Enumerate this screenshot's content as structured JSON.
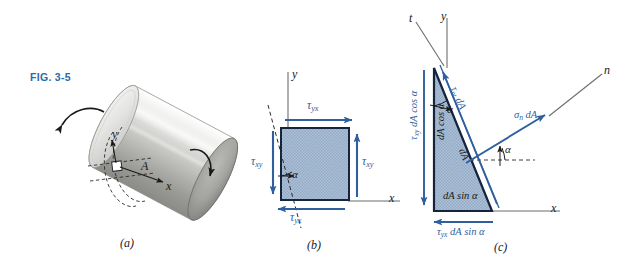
{
  "figure": {
    "id_label": "FIG. 3-5",
    "id_color": "#2f6aa8",
    "accent_color": "#2f5f9e",
    "fill_color": "#a8bdd4",
    "edge_color": "#14243c"
  },
  "panels": [
    {
      "key": "a",
      "caption": "(a)"
    },
    {
      "key": "b",
      "caption": "(b)"
    },
    {
      "key": "c",
      "caption": "(c)"
    }
  ],
  "panel_a": {
    "caption": "(a)",
    "axis_x": "x",
    "axis_y": "y",
    "point_label": "A",
    "description": "circular shaft in torsion with curved torque arrows at both ends"
  },
  "panel_b": {
    "caption": "(b)",
    "axis_x": "x",
    "axis_y": "y",
    "angle_label": "α",
    "stress_top": "τyx",
    "stress_top_sym": "τ",
    "stress_top_sub": "yx",
    "stress_bottom": "τyx",
    "stress_bottom_sym": "τ",
    "stress_bottom_sub": "yx",
    "stress_left": "τxy",
    "stress_left_sym": "τ",
    "stress_left_sub": "xy",
    "stress_right": "τxy",
    "stress_right_sym": "τ",
    "stress_right_sub": "xy"
  },
  "panel_c": {
    "caption": "(c)",
    "axis_x": "x",
    "axis_y": "y",
    "axis_n": "n",
    "axis_t": "t",
    "angle_label_top": "α",
    "angle_label_right": "α",
    "force_left_sym": "τ",
    "force_left_sub": "xy",
    "force_left_rest": " dA cos α",
    "force_left_full": "τxy dA cos α",
    "face_left_label": "dA cos α",
    "force_bottom_sym": "τ",
    "force_bottom_sub": "yx",
    "force_bottom_rest": " dA sin α",
    "force_bottom_full": "τyx dA sin α",
    "face_bottom_label": "dA sin α",
    "force_shear_sym": "τ",
    "force_shear_sub": "nt",
    "force_shear_rest": " dA",
    "force_shear_full": "τnt dA",
    "force_normal_sym": "σ",
    "force_normal_sub": "n",
    "force_normal_rest": " dA",
    "force_normal_full": "σn dA",
    "face_incline_label": "dA"
  }
}
